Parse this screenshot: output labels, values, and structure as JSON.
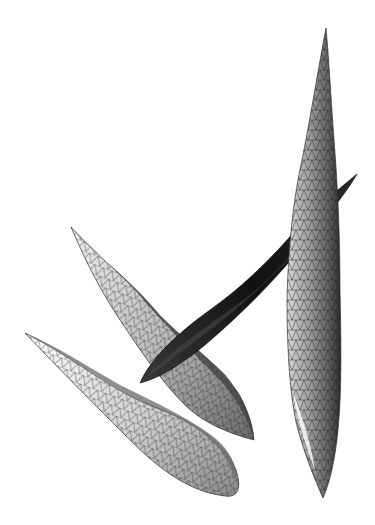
{
  "figure": {
    "description": "3D triangulated surface meshes of four leaf-like shapes rendered in grayscale",
    "background": "#ffffff",
    "mesh_line_color": "#222222",
    "shades": {
      "light": "#e6e6e6",
      "mid": "#a8a8a8",
      "dark": "#5a5a5a",
      "darkest": "#1c1c1c"
    },
    "leaves": [
      {
        "id": "tall-vertical-leaf",
        "tip_top": [
          326,
          28
        ],
        "tip_bottom": [
          323,
          498
        ]
      },
      {
        "id": "dark-diagonal-leaf",
        "tip_upper_right": [
          357,
          174
        ],
        "tip_lower_left": [
          140,
          383
        ]
      },
      {
        "id": "middle-curved-leaf",
        "start": [
          71,
          227
        ],
        "end": [
          254,
          440
        ]
      },
      {
        "id": "bottom-curved-leaf",
        "start": [
          25,
          333
        ],
        "end": [
          240,
          498
        ]
      }
    ]
  }
}
